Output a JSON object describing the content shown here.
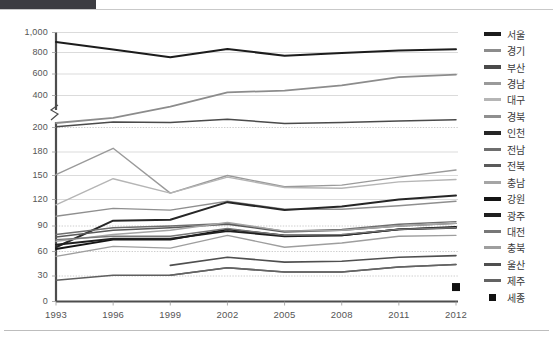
{
  "chart_data": {
    "type": "line",
    "title": "",
    "subtitle": "",
    "xlabel": "",
    "ylabel": "",
    "grid": true,
    "legend_position": "right",
    "axis_break": {
      "between": [
        200,
        400
      ],
      "note": "y-axis broken between 200 and 400"
    },
    "x": [
      "1993",
      "1996",
      "1999",
      "2002",
      "2005",
      "2008",
      "2011",
      "2012"
    ],
    "categories": [
      "1993",
      "1996",
      "1999",
      "2002",
      "2005",
      "2008",
      "2011",
      "2012"
    ],
    "yticks": [
      "1,000",
      "800",
      "600",
      "400",
      "200",
      "180",
      "150",
      "120",
      "90",
      "60",
      "30",
      "0"
    ],
    "ytick_values": [
      1000,
      800,
      600,
      400,
      200,
      180,
      150,
      120,
      90,
      60,
      30,
      0
    ],
    "ylim": [
      0,
      1000
    ],
    "series": [
      {
        "name": "서울",
        "color": "#1c1c1c",
        "width": 2.0,
        "values": [
          905,
          830,
          755,
          835,
          770,
          795,
          820,
          832
        ]
      },
      {
        "name": "경기",
        "color": "#8c8c8c",
        "width": 1.8,
        "values": [
          228,
          260,
          330,
          430,
          445,
          495,
          570,
          595
        ]
      },
      {
        "name": "부산",
        "color": "#4a4a4a",
        "width": 1.5,
        "values": [
          205,
          235,
          232,
          252,
          225,
          232,
          240,
          248
        ]
      },
      {
        "name": "경남",
        "color": "#9a9a9a",
        "width": 1.4,
        "values": [
          151,
          183,
          128,
          150,
          136,
          138,
          148,
          157
        ]
      },
      {
        "name": "대구",
        "color": "#b5b5b5",
        "width": 1.4,
        "values": [
          114,
          146,
          128,
          148,
          135,
          134,
          142,
          145
        ]
      },
      {
        "name": "경북",
        "color": "#8f8f8f",
        "width": 1.4,
        "values": [
          101,
          110,
          108,
          118,
          109,
          109,
          113,
          118
        ]
      },
      {
        "name": "인천",
        "color": "#262626",
        "width": 2.0,
        "values": [
          65,
          96,
          97,
          117,
          108,
          112,
          120,
          125
        ]
      },
      {
        "name": "전남",
        "color": "#6e6e6e",
        "width": 1.4,
        "values": [
          80,
          88,
          90,
          93,
          84,
          86,
          92,
          95
        ]
      },
      {
        "name": "전북",
        "color": "#5a5a5a",
        "width": 1.4,
        "values": [
          77,
          85,
          88,
          92,
          83,
          85,
          90,
          93
        ]
      },
      {
        "name": "충남",
        "color": "#a5a5a5",
        "width": 1.4,
        "values": [
          72,
          80,
          85,
          94,
          84,
          85,
          90,
          93
        ]
      },
      {
        "name": "강원",
        "color": "#141414",
        "width": 1.9,
        "values": [
          63,
          74,
          74,
          86,
          79,
          79,
          86,
          89
        ]
      },
      {
        "name": "광주",
        "color": "#1f1f1f",
        "width": 1.9,
        "values": [
          68,
          75,
          75,
          84,
          78,
          79,
          86,
          88
        ]
      },
      {
        "name": "대전",
        "color": "#777777",
        "width": 1.4,
        "values": [
          74,
          78,
          78,
          87,
          79,
          80,
          86,
          88
        ]
      },
      {
        "name": "충북",
        "color": "#9e9e9e",
        "width": 1.4,
        "values": [
          54,
          66,
          64,
          79,
          65,
          70,
          78,
          79
        ]
      },
      {
        "name": "울산",
        "color": "#4f4f4f",
        "width": 1.6,
        "values": [
          null,
          null,
          43,
          53,
          47,
          48,
          53,
          55
        ]
      },
      {
        "name": "제주",
        "color": "#636363",
        "width": 1.5,
        "values": [
          null,
          null,
          31,
          40,
          35,
          35,
          41,
          44
        ]
      },
      {
        "name": "세종",
        "color": "#111111",
        "width": 1.4,
        "marker": "square",
        "values": [
          null,
          null,
          null,
          null,
          null,
          null,
          null,
          17
        ]
      }
    ],
    "extra_line": {
      "name": "하위선",
      "color": "#5e5e5e",
      "values": [
        25,
        31,
        31,
        40,
        35,
        35,
        41,
        44
      ]
    }
  },
  "legend": {
    "items": [
      {
        "label": "서울",
        "color": "#1c1c1c",
        "marker": "line",
        "thick": true
      },
      {
        "label": "경기",
        "color": "#8c8c8c",
        "marker": "line",
        "thick": false
      },
      {
        "label": "부산",
        "color": "#4a4a4a",
        "marker": "line",
        "thick": true
      },
      {
        "label": "경남",
        "color": "#9a9a9a",
        "marker": "line",
        "thick": false
      },
      {
        "label": "대구",
        "color": "#b5b5b5",
        "marker": "line",
        "thick": false
      },
      {
        "label": "경북",
        "color": "#8f8f8f",
        "marker": "line",
        "thick": false
      },
      {
        "label": "인천",
        "color": "#262626",
        "marker": "line",
        "thick": true
      },
      {
        "label": "전남",
        "color": "#6e6e6e",
        "marker": "line",
        "thick": false
      },
      {
        "label": "전북",
        "color": "#5a5a5a",
        "marker": "line",
        "thick": false
      },
      {
        "label": "충남",
        "color": "#a5a5a5",
        "marker": "line",
        "thick": false
      },
      {
        "label": "강원",
        "color": "#141414",
        "marker": "line",
        "thick": true
      },
      {
        "label": "광주",
        "color": "#1f1f1f",
        "marker": "line",
        "thick": true
      },
      {
        "label": "대전",
        "color": "#777777",
        "marker": "line",
        "thick": false
      },
      {
        "label": "충북",
        "color": "#9e9e9e",
        "marker": "line",
        "thick": false
      },
      {
        "label": "울산",
        "color": "#4f4f4f",
        "marker": "line",
        "thick": false
      },
      {
        "label": "제주",
        "color": "#636363",
        "marker": "line",
        "thick": false
      },
      {
        "label": "세종",
        "color": "#111111",
        "marker": "square",
        "thick": false
      }
    ]
  },
  "axes": {
    "y_labels": [
      "1,000",
      "800",
      "600",
      "400",
      "200",
      "180",
      "150",
      "120",
      "90",
      "60",
      "30",
      "0"
    ],
    "x_labels": [
      "1993",
      "1996",
      "1999",
      "2002",
      "2005",
      "2008",
      "2011",
      "2012"
    ]
  }
}
